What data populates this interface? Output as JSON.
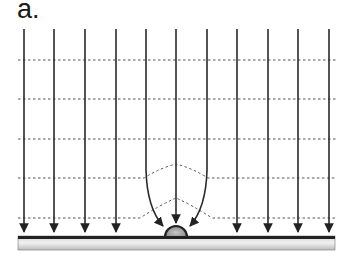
{
  "figure": {
    "panel_label": "a.",
    "field_lines_x": [
      24,
      54,
      85,
      116,
      146,
      176,
      207,
      237,
      268,
      298,
      329
    ],
    "field_line_top_y": 29,
    "arrow_tip_y": 233,
    "equipotential_lines_y": [
      60,
      99,
      139,
      178,
      218
    ],
    "bump": {
      "cx": 176,
      "base_y": 237,
      "radius": 11
    },
    "plate": {
      "x1": 18,
      "x2": 335,
      "top_y": 236,
      "bottom_y": 250
    },
    "colors": {
      "line": "#333333",
      "dashed": "#555555",
      "plate_top": "#222222",
      "plate_light": "#e8e8e8",
      "plate_mid": "#bdbdbd"
    }
  }
}
